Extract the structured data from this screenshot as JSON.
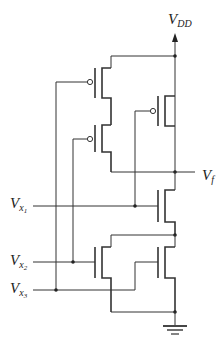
{
  "diagram": {
    "type": "CMOS logic gate schematic",
    "labels": {
      "vdd": {
        "main": "V",
        "sub": "DD"
      },
      "vf": {
        "main": "V",
        "sub": "f"
      },
      "vx1": {
        "main": "V",
        "sub": "x",
        "subsub": "1"
      },
      "vx2": {
        "main": "V",
        "sub": "x",
        "subsub": "2"
      },
      "vx3": {
        "main": "V",
        "sub": "x",
        "subsub": "3"
      }
    },
    "transistors": [
      {
        "id": "P1",
        "type": "PMOS",
        "gate": "Vx3",
        "network": "pull-up",
        "arrangement": "series with P2"
      },
      {
        "id": "P2",
        "type": "PMOS",
        "gate": "Vx2",
        "network": "pull-up",
        "arrangement": "series with P1"
      },
      {
        "id": "P3",
        "type": "PMOS",
        "gate": "Vx1",
        "network": "pull-up",
        "arrangement": "parallel with P1-P2"
      },
      {
        "id": "N1",
        "type": "NMOS",
        "gate": "Vx1",
        "network": "pull-down",
        "arrangement": "series with N2||N3"
      },
      {
        "id": "N2",
        "type": "NMOS",
        "gate": "Vx2",
        "network": "pull-down",
        "arrangement": "parallel with N3"
      },
      {
        "id": "N3",
        "type": "NMOS",
        "gate": "Vx3",
        "network": "pull-down",
        "arrangement": "parallel with N2"
      }
    ],
    "colors": {
      "line": "#333333",
      "background": "#ffffff"
    }
  }
}
